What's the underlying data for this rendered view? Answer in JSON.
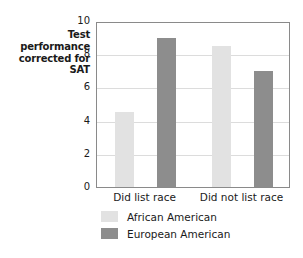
{
  "chart_data": {
    "type": "bar",
    "title": "",
    "xlabel": "",
    "ylabel": "Test performance corrected for SAT",
    "ylabel_lines": [
      "Test",
      "performance",
      "corrected for",
      "SAT"
    ],
    "categories": [
      "Did list race",
      "Did not list race"
    ],
    "series": [
      {
        "name": "African American",
        "color": "#e2e2e2",
        "values": [
          4.5,
          8.5
        ]
      },
      {
        "name": "European American",
        "color": "#8d8d8d",
        "values": [
          9.0,
          7.0
        ]
      }
    ],
    "ylim": [
      0,
      10
    ],
    "ytick_labels": [
      "0",
      "2",
      "4",
      "6",
      "8",
      "10"
    ],
    "ytick_values": [
      0,
      2,
      4,
      6,
      8,
      10
    ],
    "grid": true,
    "legend_position": "bottom-left",
    "axis_frame_color": "#8a8a8a",
    "gridline_color": "#dcdcdc",
    "background_color": "#ffffff"
  }
}
